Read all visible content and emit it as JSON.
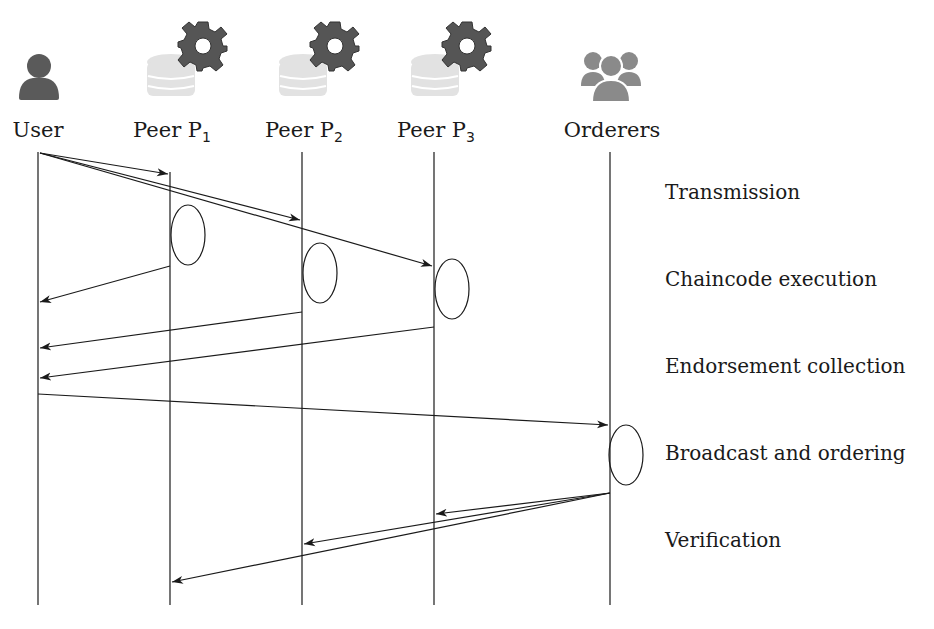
{
  "actors": [
    {
      "id": "user",
      "label": "User",
      "sub": "",
      "x": 38,
      "icon": "user-icon"
    },
    {
      "id": "p1",
      "label": "Peer P",
      "sub": "1",
      "x": 170,
      "icon": "peer-database-gear-icon"
    },
    {
      "id": "p2",
      "label": "Peer P",
      "sub": "2",
      "x": 302,
      "icon": "peer-database-gear-icon"
    },
    {
      "id": "p3",
      "label": "Peer P",
      "sub": "3",
      "x": 434,
      "icon": "peer-database-gear-icon"
    },
    {
      "id": "orderers",
      "label": "Orderers",
      "sub": "",
      "x": 610,
      "icon": "group-icon"
    }
  ],
  "phases": [
    {
      "label": "Transmission",
      "y": 193
    },
    {
      "label": "Chaincode execution",
      "y": 280
    },
    {
      "label": "Endorsement collection",
      "y": 367
    },
    {
      "label": "Broadcast and ordering",
      "y": 454
    },
    {
      "label": "Verification",
      "y": 541
    }
  ],
  "colors": {
    "icon_dark": "#5a5a5a",
    "icon_light": "#dcdcdc",
    "group": "#8a8a8a",
    "line": "#1a1a1a"
  }
}
